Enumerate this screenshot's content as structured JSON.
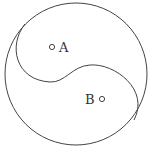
{
  "diagram": {
    "outer_circle": {
      "cx": 76,
      "cy": 74,
      "r": 71
    },
    "stroke_color": "#444444",
    "points": [
      {
        "label": "A",
        "marker_x": 52,
        "marker_y": 47,
        "label_x": 59,
        "label_y": 52
      },
      {
        "label": "B",
        "marker_x": 102,
        "marker_y": 99,
        "label_x": 85,
        "label_y": 104
      }
    ]
  }
}
